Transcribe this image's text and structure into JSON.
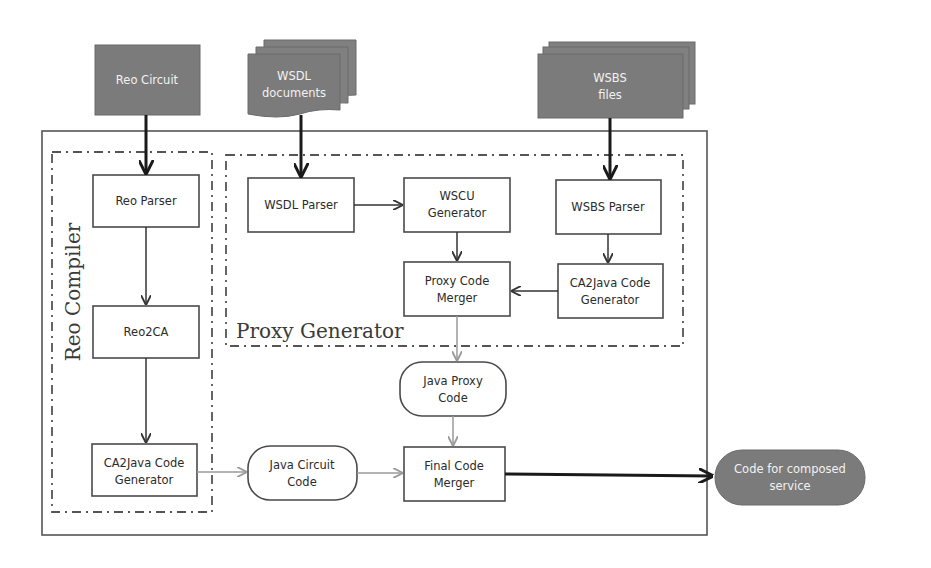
{
  "diagram": {
    "inputs": {
      "reo_circuit": {
        "label": "Reo Circuit"
      },
      "wsdl_documents": {
        "line1": "WSDL",
        "line2": "documents"
      },
      "wsbs_files": {
        "line1": "WSBS",
        "line2": "files"
      }
    },
    "groups": {
      "reo_compiler": {
        "label": "Reo Compiler"
      },
      "proxy_generator": {
        "label": "Proxy Generator"
      }
    },
    "nodes": {
      "reo_parser": {
        "label": "Reo Parser"
      },
      "reo2ca": {
        "label": "Reo2CA"
      },
      "ca2java_left": {
        "line1": "CA2Java Code",
        "line2": "Generator"
      },
      "wsdl_parser": {
        "label": "WSDL Parser"
      },
      "wscu_generator": {
        "line1": "WSCU",
        "line2": "Generator"
      },
      "wsbs_parser": {
        "label": "WSBS Parser"
      },
      "proxy_code_merger": {
        "line1": "Proxy Code",
        "line2": "Merger"
      },
      "ca2java_right": {
        "line1": "CA2Java Code",
        "line2": "Generator"
      },
      "java_proxy_code": {
        "line1": "Java Proxy",
        "line2": "Code"
      },
      "java_circuit_code": {
        "line1": "Java Circuit",
        "line2": "Code"
      },
      "final_code_merger": {
        "line1": "Final Code",
        "line2": "Merger"
      }
    },
    "output": {
      "code_for_composed_service": {
        "line1": "Code for composed",
        "line2": "service"
      }
    },
    "edges": [
      {
        "from": "Reo Circuit",
        "to": "Reo Parser"
      },
      {
        "from": "WSDL documents",
        "to": "WSDL Parser"
      },
      {
        "from": "WSBS files",
        "to": "WSBS Parser"
      },
      {
        "from": "Reo Parser",
        "to": "Reo2CA"
      },
      {
        "from": "Reo2CA",
        "to": "CA2Java Code Generator (left)"
      },
      {
        "from": "WSDL Parser",
        "to": "WSCU Generator"
      },
      {
        "from": "WSCU Generator",
        "to": "Proxy Code Merger"
      },
      {
        "from": "WSBS Parser",
        "to": "CA2Java Code Generator (right)"
      },
      {
        "from": "CA2Java Code Generator (right)",
        "to": "Proxy Code Merger"
      },
      {
        "from": "Proxy Code Merger",
        "to": "Java Proxy Code"
      },
      {
        "from": "Java Proxy Code",
        "to": "Final Code Merger"
      },
      {
        "from": "CA2Java Code Generator (left)",
        "to": "Java Circuit Code"
      },
      {
        "from": "Java Circuit Code",
        "to": "Final Code Merger"
      },
      {
        "from": "Final Code Merger",
        "to": "Code for composed service"
      }
    ]
  }
}
